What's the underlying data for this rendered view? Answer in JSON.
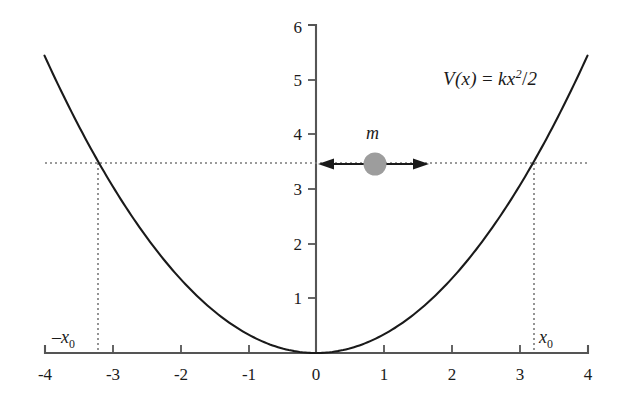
{
  "figure": {
    "title": "",
    "equation_label": "V(x) = kx²/2",
    "mass_label": "m",
    "left_turning_point_label": "−x₀",
    "right_turning_point_label": "x₀",
    "colors": {
      "curve": "#1a1a1a",
      "axis": "#555555",
      "mass_fill": "#9d9d9d",
      "dotted": "#7a7a7a",
      "text": "#1a1a1a",
      "background": "#ffffff"
    }
  },
  "chart_data": {
    "type": "line",
    "title": "",
    "subtitle": "",
    "xlabel": "",
    "ylabel": "",
    "xlim": [
      -4,
      4
    ],
    "ylim": [
      0,
      6
    ],
    "grid": false,
    "legend_position": "none",
    "x_ticks": [
      -4,
      -3,
      -2,
      -1,
      0,
      1,
      2,
      3,
      4
    ],
    "x_tick_labels": [
      "-4",
      "-3",
      "-2",
      "-1",
      "0",
      "1",
      "2",
      "3",
      "4"
    ],
    "y_ticks": [
      1,
      2,
      3,
      4,
      5,
      6
    ],
    "y_tick_labels": [
      "1",
      "2",
      "3",
      "4",
      "5",
      "6"
    ],
    "series": [
      {
        "name": "V(x) = kx^2/2",
        "formula": "y = 0.34 * x^2",
        "k_over_2": 0.34,
        "x": [
          -4.0,
          -3.75,
          -3.5,
          -3.25,
          -3.0,
          -2.75,
          -2.5,
          -2.25,
          -2.0,
          -1.75,
          -1.5,
          -1.25,
          -1.0,
          -0.75,
          -0.5,
          -0.25,
          0.0,
          0.25,
          0.5,
          0.75,
          1.0,
          1.25,
          1.5,
          1.75,
          2.0,
          2.25,
          2.5,
          2.75,
          3.0,
          3.25,
          3.5,
          3.75,
          4.0
        ],
        "values": [
          5.44,
          4.78,
          4.17,
          3.59,
          3.06,
          2.57,
          2.13,
          1.72,
          1.36,
          1.04,
          0.77,
          0.53,
          0.34,
          0.19,
          0.09,
          0.02,
          0.0,
          0.02,
          0.09,
          0.19,
          0.34,
          0.53,
          0.77,
          1.04,
          1.36,
          1.72,
          2.13,
          2.57,
          3.06,
          3.59,
          4.17,
          4.78,
          5.44
        ]
      }
    ],
    "annotations": [
      {
        "name": "energy-level-line",
        "kind": "horizontal-dotted-line",
        "y": 3.47,
        "x_from": -4.0,
        "x_to": 4.0
      },
      {
        "name": "left-turning-point-line",
        "kind": "vertical-dotted-line",
        "x": -3.2,
        "y_from": 0,
        "y_to": 3.47,
        "label": "−x₀"
      },
      {
        "name": "right-turning-point-line",
        "kind": "vertical-dotted-line",
        "x": 3.2,
        "y_from": 0,
        "y_to": 3.47,
        "label": "x₀"
      },
      {
        "name": "equation-text",
        "kind": "text",
        "x": 2.0,
        "y": 4.9,
        "text": "V(x) = kx²/2"
      },
      {
        "name": "mass-marker",
        "kind": "circle",
        "x": 0.87,
        "y": 3.47,
        "label": "m"
      },
      {
        "name": "oscillation-arrow",
        "kind": "double-headed-arrow",
        "y": 3.47,
        "x_from": -0.05,
        "x_to": 1.64
      }
    ]
  }
}
